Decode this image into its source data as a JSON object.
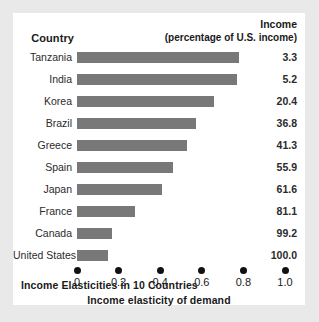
{
  "figure": {
    "caption": "Income Elasticities in 10 Countries",
    "country_header": "Country",
    "income_header_line1": "Income",
    "income_header_line2": "(percentage of U.S. income)",
    "bar_color": "#787878",
    "card_background": "#ffffff",
    "page_background": "#e9e9e9"
  },
  "chart_data": {
    "type": "bar",
    "orientation": "horizontal",
    "title": "Income Elasticities in 10 Countries",
    "xlabel": "Income elasticity of demand",
    "ylabel": "Country",
    "xlim": [
      0,
      1.0
    ],
    "grid": false,
    "legend": null,
    "categories": [
      "Tanzania",
      "India",
      "Korea",
      "Brazil",
      "Greece",
      "Spain",
      "Japan",
      "France",
      "Canada",
      "United States"
    ],
    "values": [
      0.78,
      0.77,
      0.66,
      0.57,
      0.53,
      0.46,
      0.41,
      0.28,
      0.17,
      0.15
    ],
    "tick_values": [
      0,
      0.2,
      0.4,
      0.6,
      0.8,
      1.0
    ],
    "tick_labels": [
      "0",
      "0.2",
      "0.4",
      "0.6",
      "0.8",
      "1.0"
    ],
    "series": [
      {
        "name": "Income elasticity of demand",
        "values": [
          0.78,
          0.77,
          0.66,
          0.57,
          0.53,
          0.46,
          0.41,
          0.28,
          0.17,
          0.15
        ]
      },
      {
        "name": "Income (percentage of U.S. income)",
        "values": [
          3.3,
          5.2,
          20.4,
          36.8,
          41.3,
          55.9,
          61.6,
          81.1,
          99.2,
          100.0
        ]
      }
    ],
    "rows": [
      {
        "country": "Tanzania",
        "elasticity": 0.78,
        "income": "3.3"
      },
      {
        "country": "India",
        "elasticity": 0.77,
        "income": "5.2"
      },
      {
        "country": "Korea",
        "elasticity": 0.66,
        "income": "20.4"
      },
      {
        "country": "Brazil",
        "elasticity": 0.57,
        "income": "36.8"
      },
      {
        "country": "Greece",
        "elasticity": 0.53,
        "income": "41.3"
      },
      {
        "country": "Spain",
        "elasticity": 0.46,
        "income": "55.9"
      },
      {
        "country": "Japan",
        "elasticity": 0.41,
        "income": "61.6"
      },
      {
        "country": "France",
        "elasticity": 0.28,
        "income": "81.1"
      },
      {
        "country": "Canada",
        "elasticity": 0.17,
        "income": "99.2"
      },
      {
        "country": "United States",
        "elasticity": 0.15,
        "income": "100.0"
      }
    ]
  }
}
